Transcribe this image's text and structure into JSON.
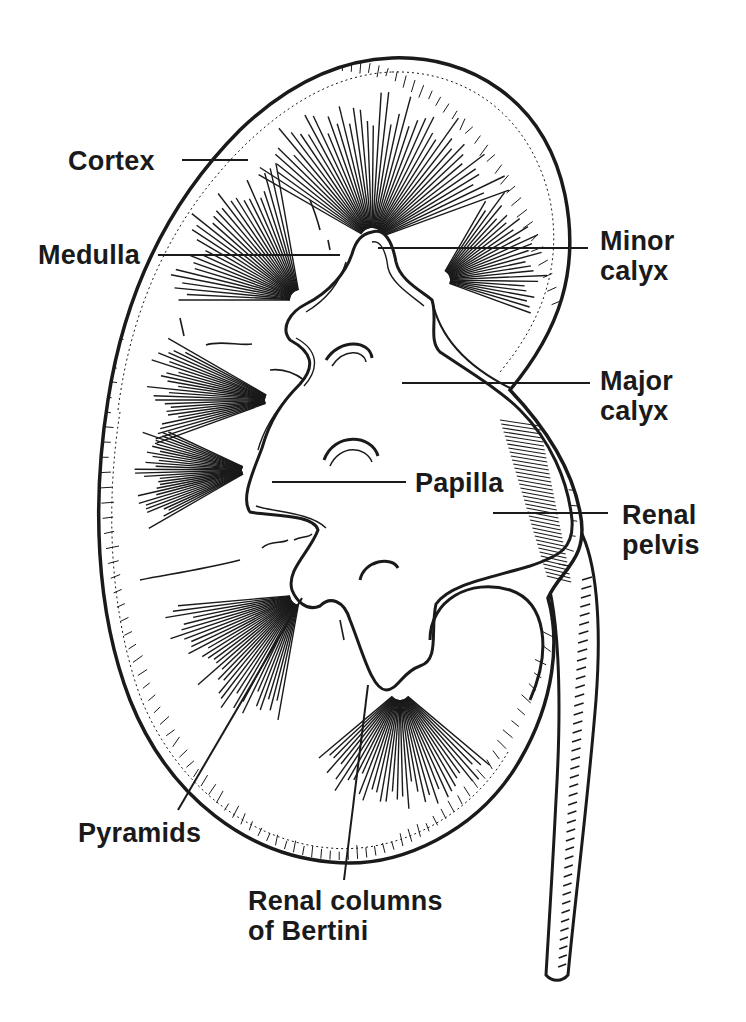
{
  "figure": {
    "ink_color": "#1a1a1a",
    "background": "#ffffff"
  },
  "labels": [
    {
      "id": "cortex",
      "text": "Cortex",
      "x": 68,
      "y": 146,
      "line": [
        182,
        160,
        248,
        160
      ]
    },
    {
      "id": "medulla",
      "text": "Medulla",
      "x": 38,
      "y": 240,
      "line": [
        158,
        255,
        340,
        255
      ]
    },
    {
      "id": "minor-calyx",
      "text": "Minor\ncalyx",
      "x": 600,
      "y": 226,
      "line": [
        378,
        248,
        588,
        248
      ]
    },
    {
      "id": "major-calyx",
      "text": "Major\ncalyx",
      "x": 600,
      "y": 366,
      "line": [
        402,
        383,
        590,
        383
      ]
    },
    {
      "id": "papilla",
      "text": "Papilla",
      "x": 415,
      "y": 468,
      "line": [
        272,
        482,
        406,
        482
      ]
    },
    {
      "id": "renal-pelvis",
      "text": "Renal\npelvis",
      "x": 622,
      "y": 500,
      "line": [
        493,
        513,
        608,
        513
      ]
    },
    {
      "id": "pyramids",
      "text": "Pyramids",
      "x": 78,
      "y": 818,
      "line": [
        178,
        810,
        302,
        598
      ]
    },
    {
      "id": "renal-columns",
      "text": "Renal columns\nof Bertini",
      "x": 248,
      "y": 886,
      "line": [
        344,
        880,
        368,
        685
      ]
    }
  ]
}
